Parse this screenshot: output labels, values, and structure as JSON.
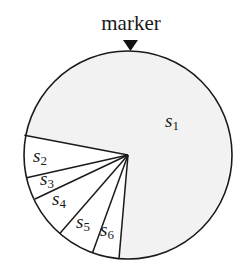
{
  "diagram": {
    "type": "roulette-wheel",
    "marker": {
      "label": "marker",
      "icon": "down-triangle-icon"
    },
    "colors": {
      "stroke": "#1a1a1a",
      "s1_fill": "#f2f2f2",
      "slot_fill": "#ffffff"
    },
    "slices": [
      {
        "name": "s",
        "sub": "1"
      },
      {
        "name": "s",
        "sub": "2"
      },
      {
        "name": "s",
        "sub": "3"
      },
      {
        "name": "s",
        "sub": "4"
      },
      {
        "name": "s",
        "sub": "5"
      },
      {
        "name": "s",
        "sub": "6"
      }
    ]
  }
}
